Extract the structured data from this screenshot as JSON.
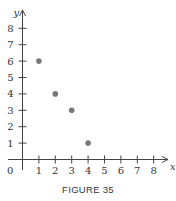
{
  "caption": "FIGURE 35",
  "chart_data": {
    "type": "scatter",
    "title": "",
    "xlabel": "x",
    "ylabel": "y",
    "x": [
      1,
      2,
      3,
      4
    ],
    "y": [
      6,
      4,
      3,
      1
    ],
    "points": [
      {
        "x": 1,
        "y": 6
      },
      {
        "x": 2,
        "y": 4
      },
      {
        "x": 3,
        "y": 3
      },
      {
        "x": 4,
        "y": 1
      }
    ],
    "xticks": [
      "1",
      "2",
      "3",
      "4",
      "5",
      "6",
      "7",
      "8"
    ],
    "yticks": [
      "1",
      "2",
      "3",
      "4",
      "5",
      "6",
      "7",
      "8"
    ],
    "origin_label": "0",
    "xlim": [
      0,
      9
    ],
    "ylim": [
      0,
      9
    ],
    "grid": false,
    "legend": null,
    "point_color": "#777777",
    "axis_color": "#444444"
  }
}
